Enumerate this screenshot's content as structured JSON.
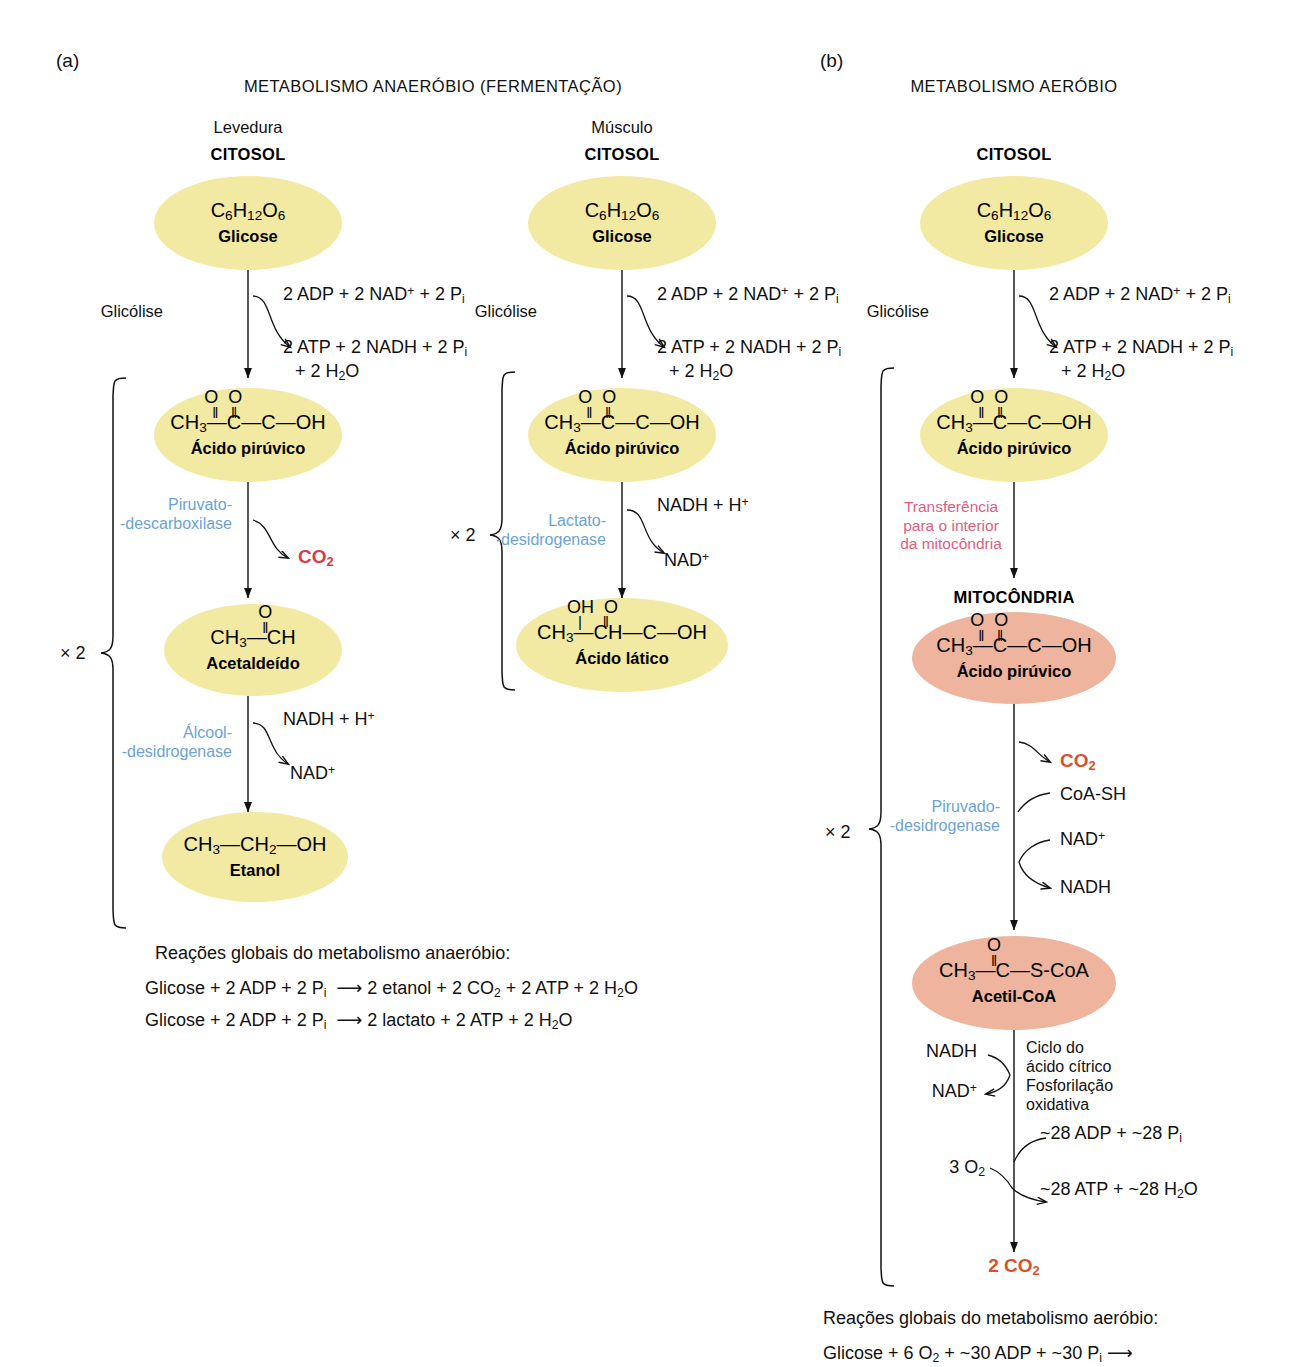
{
  "figure": {
    "panels": [
      {
        "tag": "(a)",
        "title": "METABOLISMO ANAERÓBIO (FERMENTAÇÃO)",
        "branches": [
          {
            "organism": "Levedura",
            "compartment": "CITOSOL",
            "nodes": [
              {
                "formula": "C6H12O6",
                "name": "Glicose"
              },
              {
                "formula": "CH3-CO-COOH",
                "name": "Ácido pirúvico"
              },
              {
                "formula": "CH3-CHO",
                "name": "Acetaldeído"
              },
              {
                "formula": "CH3-CH2-OH",
                "name": "Etanol"
              }
            ],
            "steps": [
              {
                "label": "Glicólise",
                "in": "2 ADP + 2 NAD+ + 2 Pi",
                "out": "2 ATP + 2 NADH + 2 Pi",
                "out2": "+ 2 H2O"
              },
              {
                "enzyme_line1": "Piruvato-",
                "enzyme_line2": "-descarboxilase",
                "out": "CO2"
              },
              {
                "enzyme_line1": "Álcool-",
                "enzyme_line2": "-desidrogenase",
                "in": "NADH + H+",
                "out": "NAD+"
              }
            ],
            "multiplier": "× 2"
          },
          {
            "organism": "Músculo",
            "compartment": "CITOSOL",
            "nodes": [
              {
                "formula": "C6H12O6",
                "name": "Glicose"
              },
              {
                "formula": "CH3-CO-COOH",
                "name": "Ácido pirúvico"
              },
              {
                "formula": "CH3-CHOH-COOH",
                "name": "Ácido lático"
              }
            ],
            "steps": [
              {
                "label": "Glicólise",
                "in": "2 ADP + 2 NAD+ + 2 Pi",
                "out": "2 ATP + 2 NADH + 2 Pi",
                "out2": "+ 2 H2O"
              },
              {
                "enzyme_line1": "Lactato-",
                "enzyme_line2": "-desidrogenase",
                "in": "NADH + H+",
                "out": "NAD+"
              }
            ],
            "multiplier": "× 2"
          }
        ],
        "summary": {
          "heading": "Reações globais do metabolismo anaeróbio:",
          "lines": [
            "Glicose + 2 ADP + 2 Pi  ⟶ 2 etanol + 2 CO2 + 2 ATP + 2 H2O",
            "Glicose + 2 ADP + 2 Pi  ⟶ 2 lactato + 2 ATP + 2 H2O"
          ]
        }
      },
      {
        "tag": "(b)",
        "title": "METABOLISMO AERÓBIO",
        "compartment_cytosol": "CITOSOL",
        "compartment_mito": "MITOCÔNDRIA",
        "nodes": [
          {
            "formula": "C6H12O6",
            "name": "Glicose"
          },
          {
            "formula": "CH3-CO-COOH",
            "name": "Ácido pirúvico"
          },
          {
            "formula": "CH3-CO-COOH",
            "name": "Ácido pirúvico"
          },
          {
            "formula": "CH3-CO-S-CoA",
            "name": "Acetil-CoA"
          }
        ],
        "steps": [
          {
            "label": "Glicólise",
            "in": "2 ADP + 2 NAD+ + 2 Pi",
            "out": "2 ATP + 2 NADH + 2 Pi",
            "out2": "+ 2 H2O"
          },
          {
            "transfer_l1": "Transferência",
            "transfer_l2": "para o interior",
            "transfer_l3": "da mitocôndria"
          },
          {
            "enzyme_line1": "Piruvado-",
            "enzyme_line2": "-desidrogenase",
            "out_co2": "CO2",
            "in_coa": "CoA-SH",
            "in_nad": "NAD+",
            "out_nadh": "NADH"
          },
          {
            "cycle_l1": "Ciclo do",
            "cycle_l2": "ácido cítrico",
            "oxphos_l1": "Fosforilação",
            "oxphos_l2": "oxidativa",
            "nadh": "NADH",
            "nad": "NAD+",
            "adp": "~28 ADP + ~28 Pi",
            "o2": "3 O2",
            "atp": "~28 ATP + ~28 H2O",
            "final_co2": "2 CO2"
          }
        ],
        "multiplier": "× 2",
        "summary": {
          "heading": "Reações globais do metabolismo aeróbio:",
          "lines": [
            "Glicose + 6 O2 + ~30 ADP + ~30 Pi ⟶"
          ]
        }
      }
    ]
  },
  "colors": {
    "yellow": "#f2eaa2",
    "pink": "#eeb49d",
    "enzyme_blue": "#6ba3d6",
    "transfer_pink": "#e0607f",
    "co2_red": "#d63b4a",
    "co2_orange": "#d9512b",
    "text": "#111111"
  }
}
